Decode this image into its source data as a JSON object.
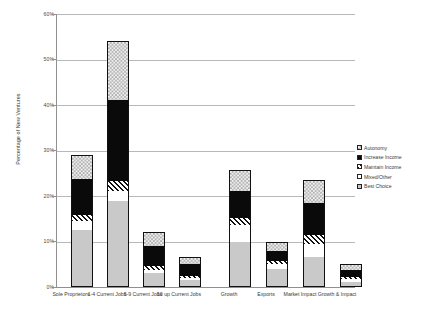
{
  "chart_data": {
    "type": "bar",
    "subtype": "stacked-bar",
    "title": "",
    "xlabel": "",
    "ylabel": "Percentage of New Ventures",
    "ylim": [
      0,
      60
    ],
    "yticks": [
      "0%",
      "10%",
      "20%",
      "30%",
      "40%",
      "50%",
      "60%"
    ],
    "ytick_values": [
      0,
      10,
      20,
      30,
      40,
      50,
      60
    ],
    "grid": true,
    "legend_position": "right",
    "categories": [
      "Sole Proprietors",
      "1-4 Current Jobs",
      "5-9 Current Jobs",
      "10 up Current Jobs",
      "Growth",
      "Exports",
      "Market Impact",
      "Growth & Impact"
    ],
    "series": [
      {
        "name": "Best Choice",
        "pattern": "solid-gray",
        "values": [
          12.5,
          19.0,
          3.0,
          1.6,
          10.0,
          4.0,
          6.5,
          1.2
        ]
      },
      {
        "name": "Mixed/Other",
        "pattern": "white",
        "values": [
          2.0,
          2.2,
          0.8,
          0.4,
          3.6,
          1.0,
          3.0,
          0.5
        ]
      },
      {
        "name": "Maintain Income",
        "pattern": "diagonal-hatch",
        "values": [
          1.4,
          2.0,
          0.9,
          0.4,
          1.6,
          0.8,
          2.0,
          0.4
        ]
      },
      {
        "name": "Increase Income",
        "pattern": "solid-black",
        "values": [
          7.8,
          18.0,
          4.4,
          2.6,
          5.8,
          2.2,
          7.0,
          1.6
        ]
      },
      {
        "name": "Autonomy",
        "pattern": "checkerboard",
        "values": [
          5.3,
          12.8,
          3.0,
          1.6,
          4.8,
          2.0,
          5.0,
          1.3
        ]
      }
    ],
    "totals": [
      29.0,
      54.0,
      12.1,
      6.6,
      25.8,
      10.0,
      23.5,
      5.0
    ],
    "legend": [
      {
        "label": "Autonomy",
        "pattern": "checkerboard"
      },
      {
        "label": "Increase Income",
        "pattern": "solid-black"
      },
      {
        "label": "Maintain Income",
        "pattern": "diagonal-hatch"
      },
      {
        "label": "Mixed/Other",
        "pattern": "white"
      },
      {
        "label": "Best Choice",
        "pattern": "solid-gray"
      }
    ],
    "colors": {
      "gridline": "#b8b8b8",
      "axis": "#909090",
      "text": "#3a3a3a",
      "best_choice": "#c9c9c9",
      "increase_income": "#0a0a0a",
      "mixed_other": "#ffffff"
    }
  }
}
